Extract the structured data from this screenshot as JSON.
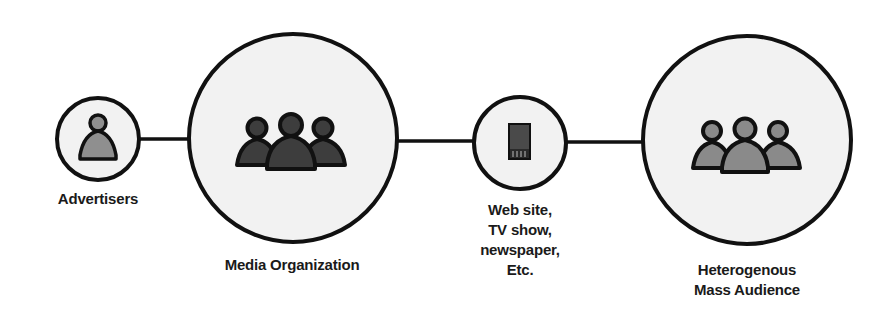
{
  "diagram": {
    "type": "flow",
    "colors": {
      "stroke": "#111111",
      "circle_fill": "#f2f2f2",
      "media_org_icon_fill": "#3d3d3d",
      "audience_icon_fill": "#8a8a8a",
      "advertiser_icon_fill": "#8f8f8f",
      "device_icon_fill": "#4a4a4a"
    },
    "nodes": [
      {
        "id": "advertisers",
        "label": "Advertisers",
        "lines": [
          "Advertisers"
        ],
        "icon": "single-person-icon",
        "size": "small"
      },
      {
        "id": "media-organization",
        "label": "Media Organization",
        "lines": [
          "Media Organization"
        ],
        "icon": "group-people-icon",
        "size": "large"
      },
      {
        "id": "media-channel",
        "label": "Web site, TV show, newspaper, Etc.",
        "lines": [
          "Web site,",
          "TV show,",
          "newspaper,",
          "Etc."
        ],
        "icon": "mobile-device-icon",
        "size": "small"
      },
      {
        "id": "mass-audience",
        "label": "Heterogenous Mass Audience",
        "lines": [
          "Heterogenous",
          "Mass Audience"
        ],
        "icon": "group-people-icon",
        "size": "large"
      }
    ],
    "edges": [
      {
        "from": "advertisers",
        "to": "media-organization"
      },
      {
        "from": "media-organization",
        "to": "media-channel"
      },
      {
        "from": "media-channel",
        "to": "mass-audience"
      }
    ]
  }
}
